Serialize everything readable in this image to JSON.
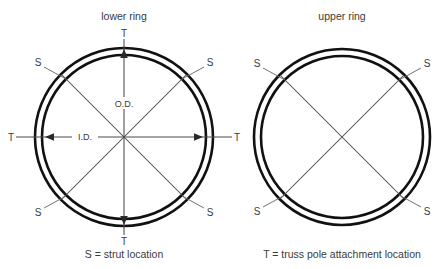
{
  "diagram": {
    "left": {
      "title": "lower ring",
      "center": {
        "x": 124,
        "y": 137
      },
      "outer_radius": 89,
      "inner_radius": 82,
      "dimension_labels": {
        "outer": "O.D.",
        "inner": "I.D."
      },
      "strut_labels": [
        "S",
        "S",
        "S",
        "S"
      ],
      "truss_labels": [
        "T",
        "T",
        "T",
        "T"
      ],
      "strut_marker": "S",
      "truss_marker": "T"
    },
    "right": {
      "title": "upper ring",
      "center": {
        "x": 342,
        "y": 137
      },
      "outer_radius": 88,
      "inner_radius": 81,
      "strut_labels": [
        "S",
        "S",
        "S",
        "S"
      ],
      "strut_marker": "S"
    },
    "legend": {
      "strut": "S = strut location",
      "truss": "T = truss pole attachment location"
    },
    "colors": {
      "ring_stroke": "#111111",
      "line_stroke": "#4a4a4a",
      "text": "#3a3a3a",
      "background": "#ffffff"
    }
  }
}
